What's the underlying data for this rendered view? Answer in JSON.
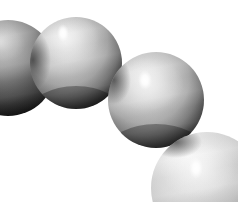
{
  "image": {
    "title": "Chain of spherical beads",
    "alt_text": "Four grayscale spheres arranged in a diagonal chain from upper left to lower right on a white background",
    "width": 238,
    "height": 202,
    "background_color": "#ffffff",
    "palette": {
      "white": "#ffffff",
      "highlight": "#fdfdfd",
      "light_gray": "#d9d9d9",
      "mid_gray": "#b4b4b4",
      "dark_gray": "#6b6b6b",
      "shadow": "#2a2a2a",
      "deep_shadow": "#101010"
    }
  },
  "objects": [
    {
      "name": "sphere-partial-left",
      "label": "Partial sphere, left edge",
      "cx": 8,
      "cy": 68,
      "r": 48,
      "top_color": "#cfcfcf",
      "mid_color": "#8a8a8a",
      "bottom_color": "#141414",
      "highlight": null,
      "clipped_edges": "left"
    },
    {
      "name": "sphere-upper-left",
      "label": "Upper left sphere",
      "cx": 76,
      "cy": 63,
      "r": 46,
      "top_color": "#e2e2e2",
      "mid_color": "#bdbdbd",
      "bottom_color": "#171717",
      "highlight": {
        "x": 63,
        "y": 33,
        "rx": 6,
        "ry": 9,
        "color": "#ffffff"
      },
      "clipped_edges": "none"
    },
    {
      "name": "sphere-center",
      "label": "Center sphere",
      "cx": 156,
      "cy": 100,
      "r": 48,
      "top_color": "#e6e6e6",
      "mid_color": "#c2c2c2",
      "bottom_color": "#1b1b1b",
      "highlight": {
        "x": 145,
        "y": 80,
        "rx": 7,
        "ry": 10,
        "color": "#ffffff"
      },
      "clipped_edges": "none"
    },
    {
      "name": "sphere-lower-right",
      "label": "Lower right sphere",
      "cx": 207,
      "cy": 188,
      "r": 56,
      "top_color": "#f0f0f0",
      "mid_color": "#d2d2d2",
      "bottom_color": "#909090",
      "highlight": {
        "x": 196,
        "y": 168,
        "rx": 7,
        "ry": 11,
        "color": "#ffffff"
      },
      "clipped_edges": "right,bottom"
    }
  ]
}
